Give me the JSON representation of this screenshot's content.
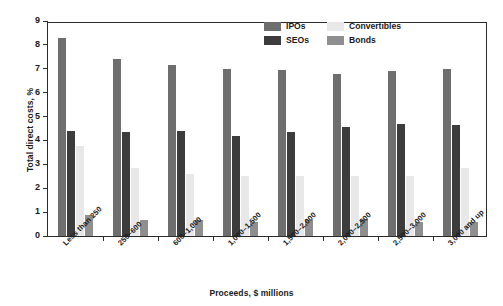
{
  "chart_data": {
    "type": "bar",
    "title": "",
    "xlabel": "Proceeds, $ millions",
    "ylabel": "Total direct costs, %",
    "ylim": [
      0,
      9
    ],
    "yticks": [
      0,
      1,
      2,
      3,
      4,
      5,
      6,
      7,
      8,
      9
    ],
    "grid": false,
    "legend_position": "top-right",
    "categories": [
      "Less than 250",
      "250–600",
      "600–1,000",
      "1,000–1,500",
      "1,500–2,000",
      "2,000–2,500",
      "2,500–3,000",
      "3,000 and up"
    ],
    "series": [
      {
        "name": "IPOs",
        "color": "#6e6e6e",
        "values": [
          8.3,
          7.4,
          7.15,
          7.0,
          6.95,
          6.8,
          6.9,
          7.0
        ]
      },
      {
        "name": "SEOs",
        "color": "#3c3c3c",
        "values": [
          4.4,
          4.35,
          4.4,
          4.2,
          4.35,
          4.55,
          4.7,
          4.65
        ]
      },
      {
        "name": "Convertibles",
        "color": "#e8e8e8",
        "values": [
          3.75,
          2.85,
          2.6,
          2.5,
          2.5,
          2.5,
          2.5,
          2.85
        ]
      },
      {
        "name": "Bonds",
        "color": "#8f8f8f",
        "values": [
          0.9,
          0.65,
          0.65,
          0.6,
          0.65,
          0.7,
          0.6,
          0.6
        ]
      }
    ]
  },
  "legend": {
    "entries": [
      {
        "label": "IPOs",
        "color": "#6e6e6e"
      },
      {
        "label": "Convertibles",
        "color": "#e8e8e8"
      },
      {
        "label": "SEOs",
        "color": "#3c3c3c"
      },
      {
        "label": "Bonds",
        "color": "#8f8f8f"
      }
    ]
  }
}
